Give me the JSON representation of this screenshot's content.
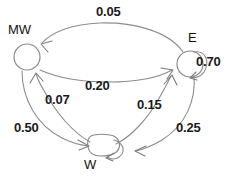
{
  "diagram": {
    "type": "state-transition-graph",
    "title": "",
    "stroke_color": "#8d8d8d",
    "text_color": "#1a1a1a",
    "background": "#ffffff",
    "nodes": [
      {
        "id": "MW",
        "label": "MW",
        "shape": "circle",
        "x": 27,
        "y": 57,
        "r": 13,
        "label_x": 8,
        "label_y": 22
      },
      {
        "id": "E",
        "label": "E",
        "shape": "circle",
        "x": 190,
        "y": 64,
        "r": 13,
        "label_x": 190,
        "label_y": 31
      },
      {
        "id": "W",
        "label": "W",
        "shape": "rounded-blob",
        "x": 103,
        "y": 146,
        "r": 13,
        "label_x": 84,
        "label_y": 157
      }
    ],
    "edges": [
      {
        "id": "e-mw",
        "from": "E",
        "to": "MW",
        "weight": "0.05",
        "label_x": 96,
        "label_y": 5
      },
      {
        "id": "e-self",
        "from": "E",
        "to": "E",
        "weight": "0.70",
        "label_x": 196,
        "label_y": 55,
        "self_loop": true
      },
      {
        "id": "mw-e",
        "from": "MW",
        "to": "E",
        "weight": "0.20",
        "label_x": 84,
        "label_y": 78
      },
      {
        "id": "w-mw",
        "from": "W",
        "to": "MW",
        "weight": "0.07",
        "label_x": 44,
        "label_y": 92
      },
      {
        "id": "w-e",
        "from": "W",
        "to": "E",
        "weight": "0.15",
        "label_x": 136,
        "label_y": 96
      },
      {
        "id": "mw-w",
        "from": "MW",
        "to": "W",
        "weight": "0.50",
        "label_x": 14,
        "label_y": 120
      },
      {
        "id": "e-w",
        "from": "E",
        "to": "W",
        "weight": "0.25",
        "label_x": 175,
        "label_y": 120
      },
      {
        "id": "w-self",
        "from": "W",
        "to": "W",
        "weight": "",
        "label_x": 0,
        "label_y": 0,
        "self_loop": true
      }
    ]
  }
}
